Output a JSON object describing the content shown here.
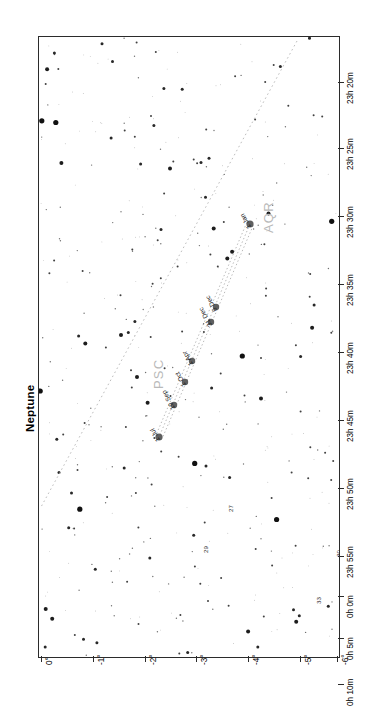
{
  "header": {
    "title": "Neptune",
    "subtitle": "January to December 2023"
  },
  "chart_data": {
    "type": "scatter",
    "title": "Neptune",
    "subtitle": "January to December 2023",
    "xlabel": "",
    "ylabel": "",
    "grid": false,
    "legend": null,
    "ra_axis": {
      "name": "Right Ascension",
      "position": "right",
      "ticks": [
        {
          "label": "23h 20m",
          "y": 46
        },
        {
          "label": "23h 25m",
          "y": 112
        },
        {
          "label": "23h 30m",
          "y": 180
        },
        {
          "label": "23h 35m",
          "y": 248
        },
        {
          "label": "23h 40m",
          "y": 316
        },
        {
          "label": "23h 45m",
          "y": 384
        },
        {
          "label": "23h 50m",
          "y": 452
        },
        {
          "label": "23h 55m",
          "y": 520
        },
        {
          "label": "0h 0m",
          "y": 560
        },
        {
          "label": "0h 5m",
          "y": 602
        },
        {
          "label": "0h 10m",
          "y": 648
        }
      ]
    },
    "dec_axis": {
      "name": "Declination",
      "position": "bottom",
      "ticks": [
        {
          "label": "0°",
          "x": 3
        },
        {
          "label": "-1°",
          "x": 55
        },
        {
          "label": "-2°",
          "x": 107
        },
        {
          "label": "-3°",
          "x": 158
        },
        {
          "label": "-4°",
          "x": 210
        },
        {
          "label": "-5°",
          "x": 262
        },
        {
          "label": "-6°",
          "x": 299
        }
      ]
    },
    "constellations": [
      {
        "label": "AQR",
        "x": 222,
        "y": 196
      },
      {
        "label": "PSC",
        "x": 112,
        "y": 352
      }
    ],
    "planet_path": {
      "name": "Neptune apparent path 2023",
      "style": "dotted loop",
      "markers": [
        {
          "label": "1 Jan",
          "x": 211,
          "y": 187
        },
        {
          "label": "6 Dec",
          "x": 177,
          "y": 270
        },
        {
          "label": "31 Dec",
          "x": 172,
          "y": 285
        },
        {
          "label": "1 Apr",
          "x": 153,
          "y": 324
        },
        {
          "label": "1 Oct",
          "x": 146,
          "y": 345
        },
        {
          "label": "19 Sep",
          "x": 135,
          "y": 368
        },
        {
          "label": "1 Jul",
          "x": 120,
          "y": 400
        }
      ]
    },
    "star_labels": [
      {
        "label": "27",
        "x": 188,
        "y": 475
      },
      {
        "label": "29",
        "x": 163,
        "y": 516
      },
      {
        "label": "30",
        "x": 296,
        "y": 520
      },
      {
        "label": "33",
        "x": 276,
        "y": 567
      }
    ],
    "ecliptic": {
      "name": "ecliptic",
      "style": "dotted"
    }
  },
  "colors": {
    "frame": "#2b2b2b",
    "star": "#111111",
    "planet_marker": "#5f5f5f",
    "constellation_label": "#b9b9b9",
    "ecliptic": "#bdbdbd",
    "background": "#ffffff"
  }
}
